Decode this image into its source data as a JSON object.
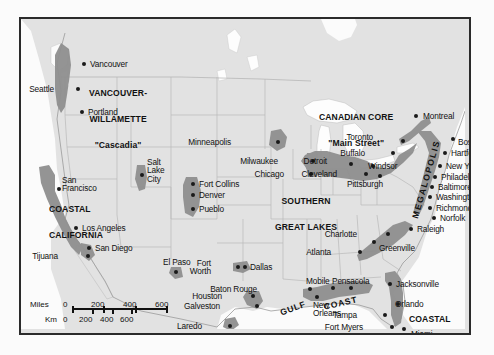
{
  "map": {
    "title": "North American Megalopolises and Urban Corridors",
    "background_color": "#e2e2e2",
    "corridor_color": "#8f8f8f",
    "water_color": "#fdfdfd",
    "border_color": "#2b2b2b",
    "dot_color": "#1a1a1a"
  },
  "regions": [
    {
      "id": "vancouver-willamette",
      "lines": [
        "VANCOUVER-",
        "WILLAMETTE",
        "\"Cascadia\""
      ],
      "x": 68,
      "y": 58
    },
    {
      "id": "coastal-california",
      "lines": [
        "COASTAL",
        "CALIFORNIA"
      ],
      "x": 45,
      "y": 173
    },
    {
      "id": "canadian-core",
      "lines": [
        "CANADIAN CORE",
        "\"Main Street\""
      ],
      "x": 317,
      "y": 82
    },
    {
      "id": "southern-great-lakes",
      "lines": [
        "SOUTHERN",
        "GREAT LAKES"
      ],
      "x": 266,
      "y": 163
    },
    {
      "id": "megalopolis",
      "label": "MEGALOPOLIS"
    },
    {
      "id": "gulf-coast",
      "label_gulf": "GULF",
      "label_coast": "COAST"
    },
    {
      "id": "coastal-florida",
      "lines": [
        "COASTAL",
        "FLORIDA"
      ],
      "x": 395,
      "y": 283
    }
  ],
  "cities": [
    {
      "name": "Vancouver",
      "dot_x": 63,
      "dot_y": 45,
      "lx": 69,
      "ly": 41,
      "anchor": "left"
    },
    {
      "name": "Seattle",
      "dot_x": 57,
      "dot_y": 70,
      "lx": 29,
      "ly": 66,
      "anchor": "right"
    },
    {
      "name": "Portland",
      "dot_x": 61,
      "dot_y": 93,
      "lx": 67,
      "ly": 89,
      "anchor": "left"
    },
    {
      "name": "San\nFrancisco",
      "dot_x": 38,
      "dot_y": 170,
      "lx": 41,
      "ly": 157,
      "anchor": "left"
    },
    {
      "name": "Los Angeles",
      "dot_x": 55,
      "dot_y": 209,
      "lx": 61,
      "ly": 205,
      "anchor": "left"
    },
    {
      "name": "San Diego",
      "dot_x": 68,
      "dot_y": 229,
      "lx": 74,
      "ly": 225,
      "anchor": "left"
    },
    {
      "name": "Tijuana",
      "dot_x": 67,
      "dot_y": 237,
      "lx": 33,
      "ly": 233,
      "anchor": "right"
    },
    {
      "name": "Salt\nLake\nCity",
      "dot_x": 121,
      "dot_y": 156,
      "lx": 126,
      "ly": 139,
      "anchor": "left"
    },
    {
      "name": "Fort Collins",
      "dot_x": 172,
      "dot_y": 165,
      "lx": 178,
      "ly": 161,
      "anchor": "left"
    },
    {
      "name": "Denver",
      "dot_x": 172,
      "dot_y": 176,
      "lx": 178,
      "ly": 172,
      "anchor": "left"
    },
    {
      "name": "Pueblo",
      "dot_x": 172,
      "dot_y": 190,
      "lx": 178,
      "ly": 186,
      "anchor": "left"
    },
    {
      "name": "El Paso",
      "dot_x": 155,
      "dot_y": 253,
      "lx": 142,
      "ly": 239,
      "anchor": "left"
    },
    {
      "name": "Minneapolis",
      "dot_x": 257,
      "dot_y": 123,
      "lx": 206,
      "ly": 119,
      "anchor": "right"
    },
    {
      "name": "Milwaukee",
      "dot_x": 292,
      "dot_y": 142,
      "lx": 253,
      "ly": 138,
      "anchor": "right"
    },
    {
      "name": "Chicago",
      "dot_x": 290,
      "dot_y": 155,
      "lx": 259,
      "ly": 151,
      "anchor": "right"
    },
    {
      "name": "Detroit",
      "dot_x": 330,
      "dot_y": 145,
      "lx": 302,
      "ly": 138,
      "anchor": "right"
    },
    {
      "name": "Cleveland",
      "dot_x": 345,
      "dot_y": 155,
      "lx": 312,
      "ly": 151,
      "anchor": "right"
    },
    {
      "name": "Windsor",
      "dot_x": 352,
      "dot_y": 147,
      "lx": 347,
      "ly": 143,
      "anchor": "left"
    },
    {
      "name": "Pittsburgh",
      "dot_x": 359,
      "dot_y": 157,
      "lx": 326,
      "ly": 161,
      "anchor": "left"
    },
    {
      "name": "Toronto",
      "dot_x": 382,
      "dot_y": 122,
      "lx": 348,
      "ly": 114,
      "anchor": "right"
    },
    {
      "name": "Buffalo",
      "dot_x": 372,
      "dot_y": 134,
      "lx": 340,
      "ly": 130,
      "anchor": "right"
    },
    {
      "name": "Montreal",
      "dot_x": 395,
      "dot_y": 97,
      "lx": 402,
      "ly": 93,
      "anchor": "left"
    },
    {
      "name": "Boston",
      "dot_x": 432,
      "dot_y": 120,
      "lx": 437,
      "ly": 119,
      "anchor": "left"
    },
    {
      "name": "Hartford",
      "dot_x": 424,
      "dot_y": 134,
      "lx": 430,
      "ly": 130,
      "anchor": "left"
    },
    {
      "name": "New York",
      "dot_x": 419,
      "dot_y": 147,
      "lx": 425,
      "ly": 143,
      "anchor": "left"
    },
    {
      "name": "Philadelphia",
      "dot_x": 414,
      "dot_y": 158,
      "lx": 420,
      "ly": 154,
      "anchor": "left"
    },
    {
      "name": "Baltimore",
      "dot_x": 411,
      "dot_y": 168,
      "lx": 417,
      "ly": 164,
      "anchor": "left"
    },
    {
      "name": "Washington D.C.",
      "dot_x": 409,
      "dot_y": 178,
      "lx": 415,
      "ly": 174,
      "anchor": "left"
    },
    {
      "name": "Richmond",
      "dot_x": 409,
      "dot_y": 189,
      "lx": 415,
      "ly": 185,
      "anchor": "left"
    },
    {
      "name": "Norfolk",
      "dot_x": 413,
      "dot_y": 199,
      "lx": 419,
      "ly": 195,
      "anchor": "left"
    },
    {
      "name": "Raleigh",
      "dot_x": 390,
      "dot_y": 210,
      "lx": 396,
      "ly": 206,
      "anchor": "left"
    },
    {
      "name": "Charlotte",
      "dot_x": 367,
      "dot_y": 215,
      "lx": 332,
      "ly": 211,
      "anchor": "right"
    },
    {
      "name": "Greenville",
      "dot_x": 353,
      "dot_y": 223,
      "lx": 358,
      "ly": 225,
      "anchor": "left"
    },
    {
      "name": "Atlanta",
      "dot_x": 339,
      "dot_y": 233,
      "lx": 306,
      "ly": 229,
      "anchor": "right"
    },
    {
      "name": "Fort\nWorth",
      "dot_x": 217,
      "dot_y": 248,
      "lx": 186,
      "ly": 240,
      "anchor": "right"
    },
    {
      "name": "Dallas",
      "dot_x": 224,
      "dot_y": 248,
      "lx": 229,
      "ly": 244,
      "anchor": "left"
    },
    {
      "name": "Baton Rouge",
      "dot_x": 289,
      "dot_y": 270,
      "lx": 232,
      "ly": 266,
      "anchor": "right"
    },
    {
      "name": "Houston",
      "dot_x": 232,
      "dot_y": 277,
      "lx": 197,
      "ly": 273,
      "anchor": "right"
    },
    {
      "name": "Galveston",
      "dot_x": 236,
      "dot_y": 287,
      "lx": 195,
      "ly": 283,
      "anchor": "right"
    },
    {
      "name": "New\nOrleans",
      "dot_x": 296,
      "dot_y": 278,
      "lx": 292,
      "ly": 282,
      "anchor": "left"
    },
    {
      "name": "Mobile",
      "dot_x": 312,
      "dot_y": 269,
      "lx": 285,
      "ly": 258,
      "anchor": "left"
    },
    {
      "name": "Pensacola",
      "dot_x": 330,
      "dot_y": 269,
      "lx": 311,
      "ly": 258,
      "anchor": "left"
    },
    {
      "name": "Jacksonville",
      "dot_x": 369,
      "dot_y": 265,
      "lx": 375,
      "ly": 261,
      "anchor": "left"
    },
    {
      "name": "Orlando",
      "dot_x": 377,
      "dot_y": 285,
      "lx": 374,
      "ly": 281,
      "anchor": "left"
    },
    {
      "name": "Tampa",
      "dot_x": 364,
      "dot_y": 296,
      "lx": 332,
      "ly": 292,
      "anchor": "right"
    },
    {
      "name": "Fort Myers",
      "dot_x": 371,
      "dot_y": 308,
      "lx": 338,
      "ly": 304,
      "anchor": "right"
    },
    {
      "name": "Miami",
      "dot_x": 383,
      "dot_y": 310,
      "lx": 390,
      "ly": 311,
      "anchor": "left"
    },
    {
      "name": "Laredo",
      "dot_x": 209,
      "dot_y": 307,
      "lx": 177,
      "ly": 303,
      "anchor": "right"
    },
    {
      "name": "Brownsville",
      "dot_x": 226,
      "dot_y": 323,
      "lx": 170,
      "ly": 319,
      "anchor": "right"
    }
  ],
  "scale": {
    "miles_label": "Miles",
    "km_label": "Km",
    "miles_ticks": [
      "0",
      "200",
      "400",
      "600"
    ],
    "km_ticks": [
      "0",
      "200",
      "400",
      "600"
    ]
  }
}
